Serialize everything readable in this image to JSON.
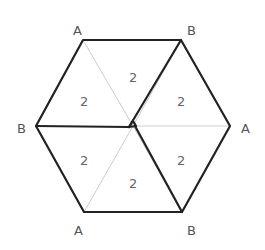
{
  "diagram": {
    "vertex_labels": [
      {
        "id": "top-left",
        "text": "A"
      },
      {
        "id": "top-right",
        "text": "B"
      },
      {
        "id": "left",
        "text": "B"
      },
      {
        "id": "right",
        "text": "A"
      },
      {
        "id": "bottom-left",
        "text": "A"
      },
      {
        "id": "bottom-right",
        "text": "B"
      }
    ],
    "region_labels": [
      {
        "id": "top",
        "text": "2"
      },
      {
        "id": "upper-left",
        "text": "2"
      },
      {
        "id": "upper-right",
        "text": "2"
      },
      {
        "id": "lower-left",
        "text": "2"
      },
      {
        "id": "lower-right",
        "text": "2"
      },
      {
        "id": "bottom",
        "text": "2"
      }
    ],
    "colors": {
      "thick_edge": "#222222",
      "thin_edge": "#cccccc",
      "label": "#555555"
    }
  }
}
